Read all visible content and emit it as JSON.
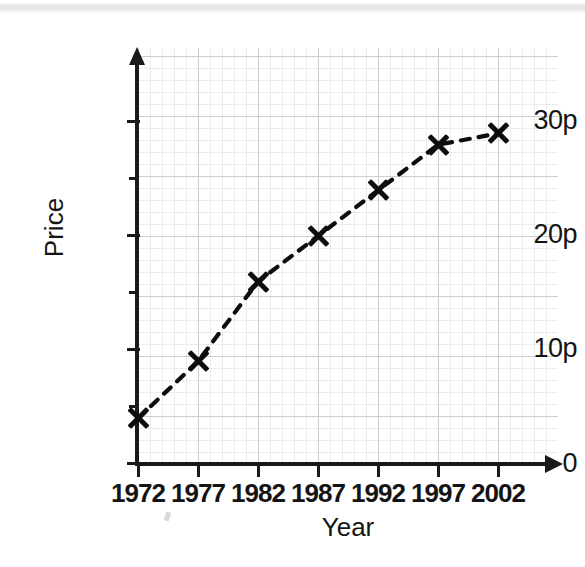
{
  "figure": {
    "background_color": "#ffffff",
    "ink_color": "#141414",
    "grid_major_color": "#c9cdd2",
    "grid_minor_color": "#e9ebee",
    "scan_band_color": "#e4e6e9"
  },
  "chart_data": {
    "type": "line",
    "title": "",
    "subtitle": "",
    "xlabel": "Year",
    "ylabel": "Price",
    "categories": [
      "1972",
      "1977",
      "1982",
      "1987",
      "1992",
      "1997",
      "2002"
    ],
    "x": [
      1972,
      1977,
      1982,
      1987,
      1992,
      1997,
      2002
    ],
    "values": [
      4,
      9,
      16,
      20,
      24,
      28,
      29
    ],
    "value_unit": "p",
    "series": [
      {
        "name": "Price",
        "values": [
          4,
          9,
          16,
          20,
          24,
          28,
          29
        ],
        "marker": "x",
        "marker_color": "#0d0d0d",
        "line_style": "dashed",
        "line_color": "#0d0d0d"
      }
    ],
    "xlim": [
      1972,
      2004
    ],
    "ylim": [
      0,
      35
    ],
    "x_tick_labels": [
      "1972",
      "1977",
      "1982",
      "1987",
      "1992",
      "1997",
      "2002"
    ],
    "y_tick_labels": [
      "0",
      "10p",
      "20p",
      "30p"
    ],
    "y_major_ticks": [
      0,
      10,
      20,
      30
    ],
    "y_minor_ticks": [
      5,
      15,
      25
    ],
    "grid": true,
    "legend": "none",
    "annotations": []
  },
  "axes": {
    "y_title": "Price",
    "x_title": "Year",
    "y_ticks": [
      {
        "label": "0",
        "value": 0
      },
      {
        "label": "",
        "value": 5
      },
      {
        "label": "10p",
        "value": 10
      },
      {
        "label": "",
        "value": 15
      },
      {
        "label": "20p",
        "value": 20
      },
      {
        "label": "",
        "value": 25
      },
      {
        "label": "30p",
        "value": 30
      }
    ],
    "x_ticks": [
      {
        "label": "1972"
      },
      {
        "label": "1977"
      },
      {
        "label": "1982"
      },
      {
        "label": "1987"
      },
      {
        "label": "1992"
      },
      {
        "label": "1997"
      },
      {
        "label": "2002"
      }
    ]
  }
}
